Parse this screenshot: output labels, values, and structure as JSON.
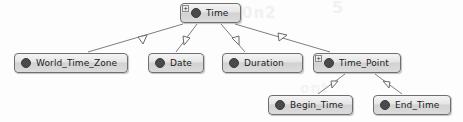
{
  "diagram": {
    "type": "generalization-tree",
    "edge_arrow": "hollow-triangle",
    "colors": {
      "node_border": "#6f6f6f",
      "node_fill_top": "#f4f4f4",
      "node_fill_bottom": "#dcdcdc",
      "bullet": "#4a4a4a",
      "edge": "#7d7d7d",
      "background": "#fdfdfd",
      "watermark": "#f1f1f1"
    },
    "expander_symbol": "+",
    "watermarks": [
      {
        "text": "0n2"
      },
      {
        "text": "5"
      },
      {
        "text": "ont"
      }
    ],
    "nodes": [
      {
        "id": "time",
        "label": "Time",
        "x": 180,
        "y": 3,
        "w": 61,
        "expandable": true,
        "bullet": "concept-bullet"
      },
      {
        "id": "world_time_zone",
        "label": "World_Time_Zone",
        "x": 14,
        "y": 53,
        "w": 114,
        "expandable": false,
        "bullet": "concept-bullet"
      },
      {
        "id": "date",
        "label": "Date",
        "x": 148,
        "y": 53,
        "w": 56,
        "expandable": false,
        "bullet": "concept-bullet"
      },
      {
        "id": "duration",
        "label": "Duration",
        "x": 222,
        "y": 53,
        "w": 81,
        "expandable": false,
        "bullet": "concept-bullet"
      },
      {
        "id": "time_point",
        "label": "Time_Point",
        "x": 313,
        "y": 53,
        "w": 88,
        "expandable": true,
        "bullet": "concept-bullet"
      },
      {
        "id": "begin_time",
        "label": "Begin_Time",
        "x": 268,
        "y": 95,
        "w": 85,
        "expandable": false,
        "bullet": "concept-bullet"
      },
      {
        "id": "end_time",
        "label": "End_Time",
        "x": 373,
        "y": 95,
        "w": 78,
        "expandable": false,
        "bullet": "concept-bullet"
      }
    ],
    "edges": [
      {
        "from": "time",
        "to": "world_time_zone",
        "label": ""
      },
      {
        "from": "time",
        "to": "date",
        "label": ""
      },
      {
        "from": "time",
        "to": "duration",
        "label": ""
      },
      {
        "from": "time",
        "to": "time_point",
        "label": ""
      },
      {
        "from": "time_point",
        "to": "begin_time",
        "label": ""
      },
      {
        "from": "time_point",
        "to": "end_time",
        "label": ""
      }
    ]
  }
}
